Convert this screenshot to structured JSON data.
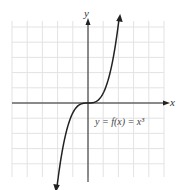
{
  "chart_data": {
    "type": "line",
    "title": "",
    "xlabel": "x",
    "ylabel": "y",
    "annotation": "y = f(x) = x³",
    "function": "x^3",
    "xlim": [
      -5,
      5
    ],
    "ylim": [
      -8.5,
      8.5
    ],
    "grid": true,
    "x_domain": [
      -2.05,
      2.05
    ],
    "series": [
      {
        "name": "y = x^3",
        "x": [
          -2,
          -1.5,
          -1,
          -0.5,
          0,
          0.5,
          1,
          1.5,
          2
        ],
        "y": [
          -8,
          -3.375,
          -1,
          -0.125,
          0,
          0.125,
          1,
          3.375,
          8
        ]
      }
    ],
    "colors": {
      "grid": "#e3e3e3",
      "axis": "#222222",
      "curve": "#222222"
    }
  }
}
